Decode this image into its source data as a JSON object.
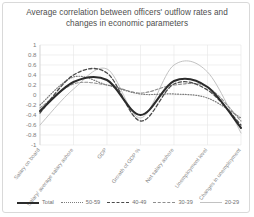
{
  "chart_data": {
    "type": "line",
    "title": "Average correlation between officers' outflow rates and changes in economic parameters",
    "xlabel": "",
    "ylabel": "",
    "ylim": [
      -1,
      1
    ],
    "grid": true,
    "legend_position": "bottom",
    "categories": [
      "Salary on board",
      "Salary/ average salary ashore",
      "GDP",
      "Growth of GDP %",
      "Net salary ashore",
      "Unemployment level",
      "Changes in unemployment"
    ],
    "yticks": [
      "1",
      "0.8",
      "0.6",
      "0.4",
      "0.2",
      "0",
      "-0.2",
      "-0.4",
      "-0.6",
      "-0.8",
      "-1"
    ],
    "ytick_values": [
      1,
      0.8,
      0.6,
      0.4,
      0.2,
      0,
      -0.2,
      -0.4,
      -0.6,
      -0.8,
      -1
    ],
    "series": [
      {
        "name": "Total",
        "style": "solid-thick",
        "color": "#2b2b2b",
        "values": [
          -0.32,
          0.26,
          0.3,
          -0.4,
          0.28,
          0.16,
          -0.66
        ]
      },
      {
        "name": "50-59",
        "style": "dotted",
        "color": "#7d7d7d",
        "values": [
          -0.2,
          0.36,
          0.2,
          0.02,
          0.02,
          -0.06,
          -0.46
        ]
      },
      {
        "name": "40-49",
        "style": "dashed",
        "color": "#4a4a4a",
        "values": [
          -0.36,
          0.4,
          0.44,
          -0.52,
          0.22,
          0.1,
          -0.6
        ]
      },
      {
        "name": "30-39",
        "style": "dash-dot",
        "color": "#8e8e8e",
        "values": [
          -0.26,
          0.22,
          0.2,
          0.04,
          0.2,
          0.16,
          -0.52
        ]
      },
      {
        "name": "20-29",
        "style": "thin",
        "color": "#c2c2c2",
        "values": [
          -0.6,
          0.12,
          0.52,
          -0.46,
          0.6,
          0.46,
          -0.76
        ]
      }
    ]
  },
  "legend": {
    "items": [
      {
        "label": "Total"
      },
      {
        "label": "50-59"
      },
      {
        "label": "40-49"
      },
      {
        "label": "30-39"
      },
      {
        "label": "20-29"
      }
    ]
  }
}
